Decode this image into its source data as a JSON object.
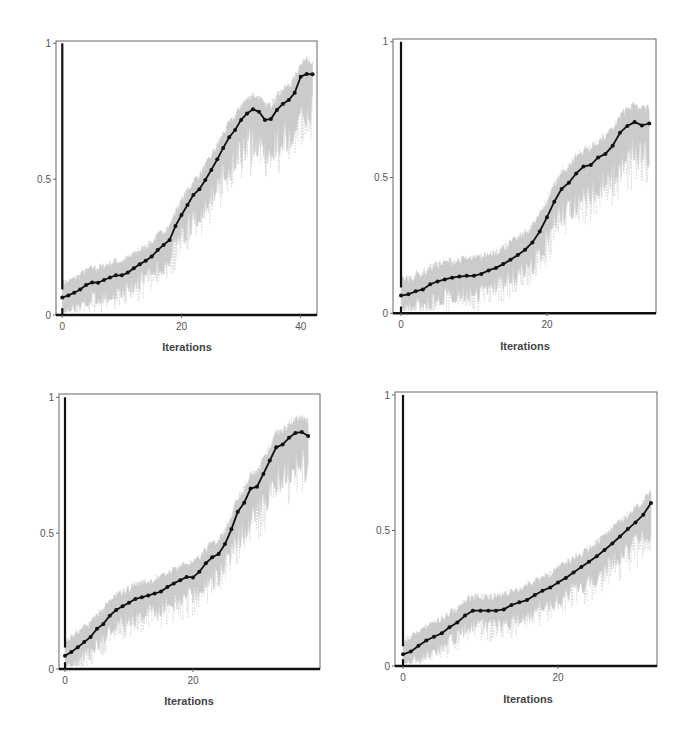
{
  "colors": {
    "line": "#111111",
    "band": "#c9c9c9",
    "frame": "#666666",
    "axis": "#111111",
    "text": "#555555"
  },
  "chart_data": [
    {
      "type": "line",
      "title": "",
      "xlabel": "Iterations",
      "ylabel": "",
      "xticks": [
        0,
        20,
        40
      ],
      "yticks": [
        0,
        0.5,
        1
      ],
      "ytick_labels": [
        "0",
        "0.5",
        "1"
      ],
      "ylim": [
        0,
        1
      ],
      "xlim": [
        0,
        43
      ],
      "grid": false,
      "legend": null,
      "series": [
        {
          "name": "mean",
          "x": [
            0,
            1,
            2,
            3,
            4,
            5,
            6,
            7,
            8,
            9,
            10,
            11,
            12,
            13,
            14,
            15,
            16,
            17,
            18,
            19,
            20,
            21,
            22,
            23,
            24,
            25,
            26,
            27,
            28,
            29,
            30,
            31,
            32,
            33,
            34,
            35,
            36,
            37,
            38,
            39,
            40,
            41,
            42
          ],
          "values": [
            0.064,
            0.072,
            0.082,
            0.094,
            0.11,
            0.12,
            0.119,
            0.129,
            0.138,
            0.146,
            0.146,
            0.156,
            0.172,
            0.187,
            0.2,
            0.215,
            0.239,
            0.258,
            0.276,
            0.328,
            0.368,
            0.405,
            0.442,
            0.463,
            0.497,
            0.534,
            0.573,
            0.615,
            0.654,
            0.681,
            0.718,
            0.742,
            0.757,
            0.748,
            0.718,
            0.721,
            0.755,
            0.777,
            0.791,
            0.818,
            0.877,
            0.887,
            0.886
          ]
        }
      ],
      "band": {
        "name": "individual runs (grey spread)",
        "upper_offset": 0.06,
        "lower_offset": 0.14
      }
    },
    {
      "type": "line",
      "title": "",
      "xlabel": "Iterations",
      "ylabel": "",
      "xticks": [
        0,
        20
      ],
      "yticks": [
        0,
        0.5,
        1
      ],
      "ytick_labels": [
        "0",
        "0.5",
        "1"
      ],
      "ylim": [
        0,
        1
      ],
      "xlim": [
        0,
        35
      ],
      "grid": false,
      "legend": null,
      "series": [
        {
          "name": "mean",
          "x": [
            0,
            1,
            2,
            3,
            4,
            5,
            6,
            7,
            8,
            9,
            10,
            11,
            12,
            13,
            14,
            15,
            16,
            17,
            18,
            19,
            20,
            21,
            22,
            23,
            24,
            25,
            26,
            27,
            28,
            29,
            30,
            31,
            32,
            33,
            34
          ],
          "values": [
            0.065,
            0.07,
            0.081,
            0.088,
            0.107,
            0.117,
            0.125,
            0.131,
            0.135,
            0.138,
            0.138,
            0.145,
            0.158,
            0.167,
            0.181,
            0.197,
            0.215,
            0.234,
            0.261,
            0.301,
            0.354,
            0.411,
            0.458,
            0.481,
            0.515,
            0.54,
            0.546,
            0.574,
            0.587,
            0.617,
            0.665,
            0.69,
            0.704,
            0.692,
            0.699
          ]
        }
      ],
      "band": {
        "name": "individual runs (grey spread)",
        "upper_offset": 0.07,
        "lower_offset": 0.15
      }
    },
    {
      "type": "line",
      "title": "",
      "xlabel": "Iterations",
      "ylabel": "",
      "xticks": [
        0,
        20
      ],
      "yticks": [
        0,
        0.5,
        1
      ],
      "ytick_labels": [
        "0",
        "0.5",
        "1"
      ],
      "ylim": [
        0,
        1
      ],
      "xlim": [
        0,
        39
      ],
      "grid": false,
      "legend": null,
      "series": [
        {
          "name": "mean",
          "x": [
            0,
            1,
            2,
            3,
            4,
            5,
            6,
            7,
            8,
            9,
            10,
            11,
            12,
            13,
            14,
            15,
            16,
            17,
            18,
            19,
            20,
            21,
            22,
            23,
            24,
            25,
            26,
            27,
            28,
            29,
            30,
            31,
            32,
            33,
            34,
            35,
            36,
            37,
            38
          ],
          "values": [
            0.049,
            0.063,
            0.08,
            0.099,
            0.118,
            0.148,
            0.166,
            0.196,
            0.217,
            0.231,
            0.244,
            0.258,
            0.264,
            0.271,
            0.278,
            0.285,
            0.302,
            0.315,
            0.327,
            0.339,
            0.337,
            0.358,
            0.389,
            0.411,
            0.423,
            0.46,
            0.514,
            0.579,
            0.612,
            0.664,
            0.671,
            0.718,
            0.767,
            0.816,
            0.826,
            0.851,
            0.869,
            0.872,
            0.858
          ]
        }
      ],
      "band": {
        "name": "individual runs (grey spread)",
        "upper_offset": 0.06,
        "lower_offset": 0.13
      }
    },
    {
      "type": "line",
      "title": "",
      "xlabel": "Iterations",
      "ylabel": "",
      "xticks": [
        0,
        20
      ],
      "yticks": [
        0,
        0.5,
        1
      ],
      "ytick_labels": [
        "0",
        "0.5",
        "1"
      ],
      "ylim": [
        0,
        1
      ],
      "xlim": [
        0,
        33
      ],
      "grid": false,
      "legend": null,
      "series": [
        {
          "name": "mean",
          "x": [
            0,
            1,
            2,
            3,
            4,
            5,
            6,
            7,
            8,
            9,
            10,
            11,
            12,
            13,
            14,
            15,
            16,
            17,
            18,
            19,
            20,
            21,
            22,
            23,
            24,
            25,
            26,
            27,
            28,
            29,
            30,
            31,
            32
          ],
          "values": [
            0.043,
            0.053,
            0.075,
            0.094,
            0.108,
            0.121,
            0.143,
            0.161,
            0.186,
            0.204,
            0.204,
            0.204,
            0.204,
            0.209,
            0.225,
            0.235,
            0.243,
            0.262,
            0.278,
            0.29,
            0.308,
            0.325,
            0.345,
            0.365,
            0.385,
            0.405,
            0.428,
            0.452,
            0.478,
            0.505,
            0.53,
            0.558,
            0.602
          ]
        }
      ],
      "band": {
        "name": "individual runs (grey spread)",
        "upper_offset": 0.06,
        "lower_offset": 0.12
      }
    }
  ],
  "panels": [
    {
      "label_xaxis": "Iterations",
      "frame": {
        "l": 56,
        "r": 317,
        "t": 41,
        "b": 315
      },
      "x0": 62.3,
      "px_per_iter": 5.96,
      "y0": 315,
      "y1": 43.3
    },
    {
      "label_xaxis": "Iterations",
      "frame": {
        "l": 393,
        "r": 656,
        "t": 39,
        "b": 313
      },
      "x0": 401,
      "px_per_iter": 7.3,
      "y0": 313.3,
      "y1": 41.7
    },
    {
      "label_xaxis": "Iterations",
      "frame": {
        "l": 59,
        "r": 320,
        "t": 394,
        "b": 669
      },
      "x0": 65,
      "px_per_iter": 6.4,
      "y0": 669,
      "y1": 397.3
    },
    {
      "label_xaxis": "Iterations",
      "frame": {
        "l": 395,
        "r": 657,
        "t": 392,
        "b": 666
      },
      "x0": 403,
      "px_per_iter": 7.75,
      "y0": 666,
      "y1": 395
    }
  ]
}
